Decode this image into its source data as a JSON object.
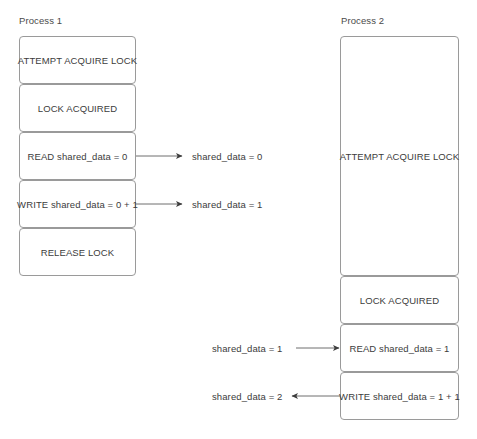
{
  "diagram": {
    "title_p1": "Process 1",
    "title_p2": "Process 2",
    "border_color": "#9a9a9a",
    "text_color": "#3c3c3c",
    "background": "#ffffff"
  },
  "process1": {
    "label": "Process 1",
    "steps": [
      {
        "text": "ATTEMPT ACQUIRE LOCK"
      },
      {
        "text": "LOCK ACQUIRED"
      },
      {
        "text": "READ shared_data = 0"
      },
      {
        "text": "WRITE shared_data = 0 + 1"
      },
      {
        "text": "RELEASE LOCK"
      }
    ]
  },
  "process2": {
    "label": "Process 2",
    "steps": [
      {
        "text": "ATTEMPT ACQUIRE LOCK"
      },
      {
        "text": "LOCK ACQUIRED"
      },
      {
        "text": "READ shared_data = 1"
      },
      {
        "text": "WRITE shared_data = 1 + 1"
      }
    ]
  },
  "arrows": [
    {
      "label": "shared_data = 0",
      "direction": "right"
    },
    {
      "label": "shared_data = 1",
      "direction": "right"
    },
    {
      "label": "shared_data = 1",
      "direction": "right"
    },
    {
      "label": "shared_data = 2",
      "direction": "left"
    }
  ]
}
